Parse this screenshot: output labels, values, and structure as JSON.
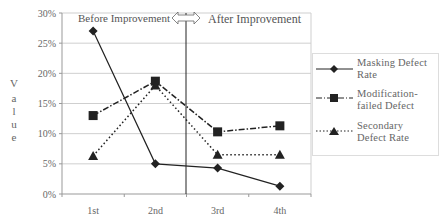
{
  "chart_data": {
    "type": "line",
    "title": "",
    "xlabel": "",
    "ylabel": "Value",
    "categories": [
      "1st",
      "2nd",
      "3rd",
      "4th"
    ],
    "ylim": [
      0,
      30
    ],
    "yticks": [
      "0%",
      "5%",
      "10%",
      "15%",
      "20%",
      "25%",
      "30%"
    ],
    "grid": true,
    "legend_position": "right",
    "series": [
      {
        "name": "Masking Defect Rate",
        "marker": "diamond",
        "line": "solid",
        "values": [
          27.0,
          5.0,
          4.3,
          1.3
        ]
      },
      {
        "name": "Modification-failed Defect",
        "marker": "square",
        "line": "dash-dot",
        "values": [
          13.0,
          18.7,
          10.3,
          11.3
        ]
      },
      {
        "name": "Secondary Defect Rate",
        "marker": "triangle",
        "line": "dotted",
        "values": [
          6.3,
          18.0,
          6.5,
          6.5
        ]
      }
    ],
    "annotations": [
      {
        "text": "Before Improvement",
        "position": "top-left"
      },
      {
        "text": "After Improvement",
        "position": "top-right"
      },
      {
        "text": "double-arrow divider",
        "between": [
          "2nd",
          "3rd"
        ]
      }
    ]
  },
  "labels": {
    "before": "Before Improvement",
    "after": "After Improvement",
    "ylabel_chars": [
      "V",
      "a",
      "l",
      "u",
      "e"
    ]
  },
  "legend": {
    "items": [
      {
        "line1": "Masking Defect",
        "line2": "Rate"
      },
      {
        "line1": "Modification-",
        "line2": "failed Defect"
      },
      {
        "line1": "Secondary",
        "line2": "Defect Rate"
      }
    ]
  },
  "colors": {
    "grid": "#cfcfcf",
    "axis": "#999999",
    "series": "#222222",
    "text": "#666666"
  }
}
